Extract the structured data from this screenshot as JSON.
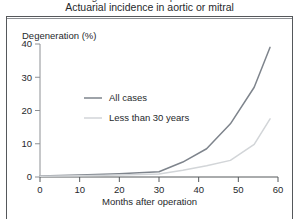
{
  "figure": {
    "caption_cut_line": "Degeneration of bioprostheses",
    "caption": "Actuarial incidence in aortic or mitral"
  },
  "chart_data": {
    "type": "line",
    "title": "Actuarial incidence in aortic or mitral",
    "xlabel": "Months after operation",
    "ylabel": "Degeneration (%)",
    "xlim": [
      0,
      60
    ],
    "ylim": [
      0,
      40
    ],
    "xticks": [
      0,
      10,
      20,
      30,
      40,
      50,
      60
    ],
    "yticks": [
      0,
      10,
      20,
      30,
      40
    ],
    "grid": false,
    "legend_position": "upper-center-left",
    "series": [
      {
        "name": "All cases",
        "color": "#7e848c",
        "x": [
          0,
          10,
          20,
          30,
          36,
          42,
          48,
          54,
          58
        ],
        "values": [
          0.3,
          0.6,
          1.0,
          1.6,
          4.5,
          8.5,
          16.0,
          27.0,
          39.0
        ]
      },
      {
        "name": "Less than 30 years",
        "color": "#d2d5d8",
        "x": [
          0,
          10,
          20,
          30,
          36,
          42,
          48,
          54,
          58
        ],
        "values": [
          0.2,
          0.4,
          0.6,
          0.9,
          2.0,
          3.4,
          5.0,
          9.8,
          17.5
        ]
      }
    ]
  }
}
